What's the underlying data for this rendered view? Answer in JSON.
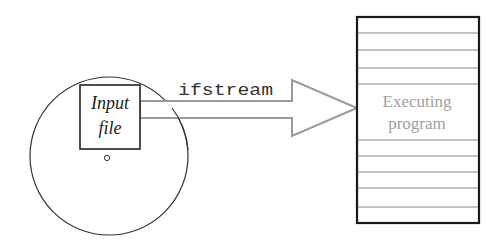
{
  "diagram": {
    "disk": {
      "file_label_line1": "Input",
      "file_label_line2": "file"
    },
    "stream": {
      "label": "ifstream"
    },
    "program": {
      "label_line1": "Executing",
      "label_line2": "program"
    },
    "colors": {
      "outline": "#222222",
      "arrow": "#9a9a9a",
      "program_text": "#a0a0a0",
      "memory_lines": "#888888"
    }
  }
}
